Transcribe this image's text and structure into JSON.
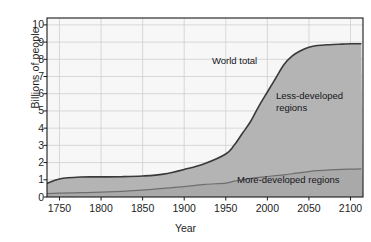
{
  "chart_data": {
    "type": "area",
    "title": "",
    "xlabel": "Year",
    "ylabel": "Billions of people",
    "xlim": [
      1735,
      2115
    ],
    "ylim": [
      0,
      10.4
    ],
    "xticks": [
      1750,
      1800,
      1850,
      1900,
      1950,
      2000,
      2050,
      2100
    ],
    "yticks": [
      0,
      1,
      2,
      3,
      4,
      5,
      6,
      7,
      8,
      9,
      10
    ],
    "grid": true,
    "legend_position": "inline-annotations",
    "annotations": [
      {
        "name": "world-total",
        "text": "World total",
        "x": 1965,
        "y": 7.6
      },
      {
        "name": "less-developed",
        "text": "Less-developed\nregions",
        "x": 2045,
        "y": 5.7
      },
      {
        "name": "more-developed",
        "text": "More-developed regions",
        "x": 2015,
        "y": 0.8
      }
    ],
    "x": [
      1735,
      1750,
      1775,
      1800,
      1825,
      1850,
      1875,
      1900,
      1925,
      1950,
      1960,
      1970,
      1980,
      1990,
      2000,
      2010,
      2020,
      2030,
      2040,
      2050,
      2060,
      2075,
      2090,
      2100,
      2113
    ],
    "series": [
      {
        "name": "World total",
        "stacked_top": true,
        "values": [
          0.79,
          1.05,
          1.16,
          1.17,
          1.18,
          1.22,
          1.33,
          1.6,
          1.95,
          2.5,
          3.0,
          3.7,
          4.4,
          5.3,
          6.1,
          6.9,
          7.7,
          8.2,
          8.5,
          8.7,
          8.8,
          8.85,
          8.88,
          8.9,
          8.9
        ]
      },
      {
        "name": "More-developed regions",
        "values": [
          0.2,
          0.22,
          0.25,
          0.28,
          0.33,
          0.4,
          0.5,
          0.6,
          0.73,
          0.81,
          0.92,
          1.0,
          1.08,
          1.14,
          1.19,
          1.24,
          1.29,
          1.35,
          1.42,
          1.48,
          1.53,
          1.58,
          1.61,
          1.62,
          1.63
        ]
      },
      {
        "name": "Less-developed regions",
        "derived": "World total minus More-developed regions"
      }
    ],
    "colors": {
      "plot_background": "#f7f7f8",
      "area_fill": "#b4b4b4",
      "curve_line": "#3a3a3a",
      "gridline": "#cfcfcf",
      "axis": "#1a1a1a"
    }
  },
  "caption": {
    "text": ""
  }
}
